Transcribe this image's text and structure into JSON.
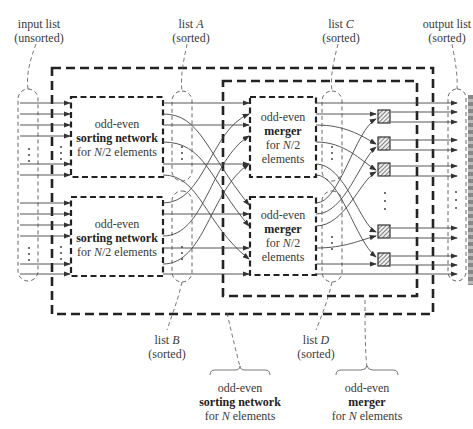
{
  "diagram": {
    "labels": {
      "input_list": {
        "line1": "input list",
        "line2": "(unsorted)"
      },
      "list_a": {
        "line1_prefix": "list ",
        "line1_var": "A",
        "line2": "(sorted)"
      },
      "list_b": {
        "line1_prefix": "list ",
        "line1_var": "B",
        "line2": "(sorted)"
      },
      "list_c": {
        "line1_prefix": "list ",
        "line1_var": "C",
        "line2": "(sorted)"
      },
      "list_d": {
        "line1_prefix": "list ",
        "line1_var": "D",
        "line2": "(sorted)"
      },
      "output_list": {
        "line1": "output list",
        "line2": "(sorted)"
      },
      "sorting_network_n": {
        "line1": "odd-even",
        "line2": "sorting network",
        "line3_prefix": "for ",
        "line3_var": "N",
        "line3_suffix": " elements"
      },
      "merger_n": {
        "line1": "odd-even",
        "line2": "merger",
        "line3_prefix": "for ",
        "line3_var": "N",
        "line3_suffix": " elements"
      }
    },
    "boxes": {
      "sort_top": {
        "line1": "odd-even",
        "line2": "sorting network",
        "line3_prefix": "for ",
        "line3_var": "N",
        "line3_suffix": "/2 elements"
      },
      "sort_bottom": {
        "line1": "odd-even",
        "line2": "sorting network",
        "line3_prefix": "for ",
        "line3_var": "N",
        "line3_suffix": "/2 elements"
      },
      "merge_top": {
        "line1": "odd-even",
        "line2": "merger",
        "line3_prefix": "for ",
        "line3_var": "N",
        "line3_suffix": "/2",
        "line4": "elements"
      },
      "merge_bottom": {
        "line1": "odd-even",
        "line2": "merger",
        "line3_prefix": "for ",
        "line3_var": "N",
        "line3_suffix": "/2",
        "line4": "elements"
      }
    },
    "comparator_count_visible": 5,
    "ellipsis": "⋮",
    "colors": {
      "stroke": "#333333",
      "thin": "#555555",
      "hatch": "#666666"
    }
  }
}
